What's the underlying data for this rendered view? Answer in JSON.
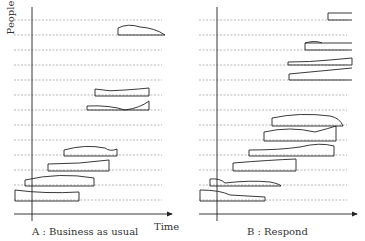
{
  "panels": [
    {
      "caption": "A : Business as usual",
      "y_label": "People",
      "x_label": "Time"
    },
    {
      "caption": "B : Respond"
    }
  ]
}
